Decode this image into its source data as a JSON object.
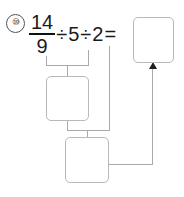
{
  "problem": {
    "number_label": "⑩",
    "expression": {
      "fraction": {
        "numerator": "14",
        "denominator": "9"
      },
      "op1": "÷",
      "operand1": "5",
      "op2": "÷",
      "operand2": "2",
      "equals": "="
    },
    "expression_plain": "14/9 ÷ 5 ÷ 2 ="
  },
  "answer_boxes": [
    {
      "id": "result",
      "value": "",
      "placeholder": ""
    },
    {
      "id": "step1",
      "value": "",
      "placeholder": ""
    },
    {
      "id": "step2",
      "value": "",
      "placeholder": ""
    }
  ],
  "connectors": {
    "bracket_top_label": "",
    "bracket_mid_label": "",
    "arrow_label": ""
  },
  "colors": {
    "ink": "#1a1a1a",
    "box_border": "#b9b9b9",
    "line": "#a9a9a9",
    "arrow": "#1d1d1d",
    "page": "#ffffff"
  }
}
